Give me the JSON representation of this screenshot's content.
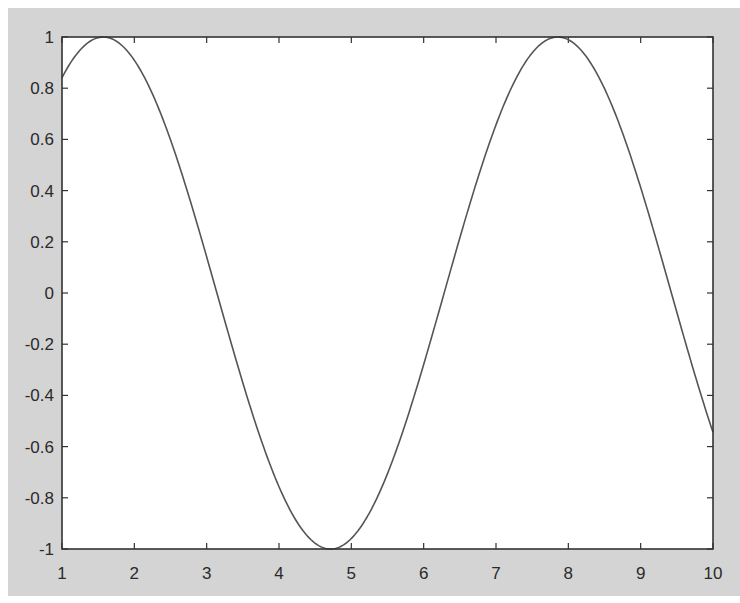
{
  "chart_data": {
    "type": "line",
    "title": "",
    "xlabel": "",
    "ylabel": "",
    "xlim": [
      1,
      10
    ],
    "ylim": [
      -1,
      1
    ],
    "grid": false,
    "legend": null,
    "function": "y = sin(x)",
    "x_ticks": [
      1,
      2,
      3,
      4,
      5,
      6,
      7,
      8,
      9,
      10
    ],
    "x_tick_labels": [
      "1",
      "2",
      "3",
      "4",
      "5",
      "6",
      "7",
      "8",
      "9",
      "10"
    ],
    "y_ticks": [
      1,
      0.8,
      0.6,
      0.4,
      0.2,
      0,
      -0.2,
      -0.4,
      -0.6,
      -0.8,
      -1
    ],
    "y_tick_labels": [
      "1",
      "0.8",
      "0.6",
      "0.4",
      "0.2",
      "0",
      "-0.2",
      "-0.4",
      "-0.6",
      "-0.8",
      "-1"
    ],
    "series": [
      {
        "name": "sin(x)",
        "color": "#555555",
        "x": [
          1.0,
          1.5,
          2.0,
          2.5,
          3.0,
          3.5,
          4.0,
          4.5,
          5.0,
          5.5,
          6.0,
          6.5,
          7.0,
          7.5,
          8.0,
          8.5,
          9.0,
          9.5,
          10.0
        ],
        "y": [
          0.841,
          0.997,
          0.909,
          0.598,
          0.141,
          -0.351,
          -0.757,
          -0.978,
          -0.959,
          -0.706,
          -0.279,
          0.215,
          0.657,
          0.938,
          0.989,
          0.798,
          0.412,
          -0.075,
          -0.544
        ]
      }
    ],
    "key_points": {
      "max_1": {
        "x": 1.571,
        "y": 1
      },
      "min_1": {
        "x": 4.712,
        "y": -1
      },
      "max_2": {
        "x": 7.854,
        "y": 1
      },
      "end": {
        "x": 10,
        "y": -0.544
      }
    }
  },
  "colors": {
    "figure_background": "#d4d4d4",
    "plot_background": "#ffffff",
    "axis": "#333333",
    "line": "#555555"
  }
}
